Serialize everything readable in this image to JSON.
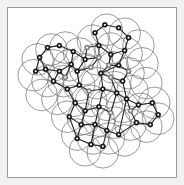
{
  "figure": {
    "kind": "ball-and-stick skeleton overlaid with van der Waals sphere outlines",
    "caption": "",
    "frame": {
      "outer_background": "#f2f2f0",
      "inner_background": "#ffffff",
      "border_color": "#9a9a9a",
      "border_width_px": 1,
      "inset_px": 7,
      "width_px": 170,
      "height_px": 171
    },
    "style": {
      "sphere_stroke": "#6d6d6d",
      "sphere_stroke_width": 0.7,
      "bond_stroke": "#2b2b2b",
      "bond_stroke_width": 1.15,
      "atom_dark_fill": "#1c1c1c",
      "atom_light_fill": "#8e8e8e",
      "atom_core_fill": "#ffffff",
      "atom_radius_px": 2.6,
      "atom_core_radius_px": 1.05
    },
    "counts": {
      "atoms": 52,
      "bonds": 58,
      "spheres": 46
    }
  },
  "chart_data": {
    "type": "scatter",
    "xlabel": "",
    "ylabel": "",
    "xlim": [
      0,
      170
    ],
    "ylim": [
      0,
      171
    ],
    "grid": false,
    "legend": "none",
    "spheres": [
      {
        "cx": 100,
        "cy": 22,
        "r": 16
      },
      {
        "cx": 118,
        "cy": 26,
        "r": 16
      },
      {
        "cx": 86,
        "cy": 33,
        "r": 16
      },
      {
        "cx": 132,
        "cy": 38,
        "r": 16
      },
      {
        "cx": 104,
        "cy": 41,
        "r": 16
      },
      {
        "cx": 120,
        "cy": 46,
        "r": 16
      },
      {
        "cx": 72,
        "cy": 46,
        "r": 16
      },
      {
        "cx": 90,
        "cy": 52,
        "r": 16
      },
      {
        "cx": 136,
        "cy": 56,
        "r": 16
      },
      {
        "cx": 44,
        "cy": 42,
        "r": 16
      },
      {
        "cx": 58,
        "cy": 40,
        "r": 16
      },
      {
        "cx": 30,
        "cy": 52,
        "r": 16
      },
      {
        "cx": 46,
        "cy": 58,
        "r": 16
      },
      {
        "cx": 62,
        "cy": 58,
        "r": 16
      },
      {
        "cx": 78,
        "cy": 62,
        "r": 16
      },
      {
        "cx": 106,
        "cy": 60,
        "r": 16
      },
      {
        "cx": 122,
        "cy": 66,
        "r": 16
      },
      {
        "cx": 26,
        "cy": 68,
        "r": 16
      },
      {
        "cx": 40,
        "cy": 74,
        "r": 16
      },
      {
        "cx": 56,
        "cy": 74,
        "r": 16
      },
      {
        "cx": 72,
        "cy": 78,
        "r": 16
      },
      {
        "cx": 90,
        "cy": 76,
        "r": 16
      },
      {
        "cx": 108,
        "cy": 80,
        "r": 16
      },
      {
        "cx": 126,
        "cy": 84,
        "r": 16
      },
      {
        "cx": 140,
        "cy": 76,
        "r": 16
      },
      {
        "cx": 34,
        "cy": 88,
        "r": 16
      },
      {
        "cx": 50,
        "cy": 92,
        "r": 16
      },
      {
        "cx": 66,
        "cy": 94,
        "r": 16
      },
      {
        "cx": 84,
        "cy": 94,
        "r": 16
      },
      {
        "cx": 100,
        "cy": 98,
        "r": 16
      },
      {
        "cx": 116,
        "cy": 100,
        "r": 16
      },
      {
        "cx": 134,
        "cy": 102,
        "r": 16
      },
      {
        "cx": 148,
        "cy": 96,
        "r": 16
      },
      {
        "cx": 60,
        "cy": 110,
        "r": 16
      },
      {
        "cx": 76,
        "cy": 112,
        "r": 16
      },
      {
        "cx": 92,
        "cy": 114,
        "r": 16
      },
      {
        "cx": 108,
        "cy": 116,
        "r": 16
      },
      {
        "cx": 124,
        "cy": 118,
        "r": 16
      },
      {
        "cx": 140,
        "cy": 120,
        "r": 16
      },
      {
        "cx": 152,
        "cy": 112,
        "r": 16
      },
      {
        "cx": 70,
        "cy": 128,
        "r": 16
      },
      {
        "cx": 86,
        "cy": 132,
        "r": 16
      },
      {
        "cx": 102,
        "cy": 132,
        "r": 16
      },
      {
        "cx": 118,
        "cy": 134,
        "r": 16
      },
      {
        "cx": 78,
        "cy": 144,
        "r": 16
      },
      {
        "cx": 96,
        "cy": 146,
        "r": 16
      }
    ],
    "atoms": [
      {
        "id": 0,
        "x": 98,
        "y": 17,
        "shade": "dark"
      },
      {
        "id": 1,
        "x": 112,
        "y": 20,
        "shade": "dark"
      },
      {
        "id": 2,
        "x": 122,
        "y": 30,
        "shade": "dark"
      },
      {
        "id": 3,
        "x": 118,
        "y": 43,
        "shade": "dark"
      },
      {
        "id": 4,
        "x": 104,
        "y": 47,
        "shade": "dark"
      },
      {
        "id": 5,
        "x": 92,
        "y": 38,
        "shade": "dark"
      },
      {
        "id": 6,
        "x": 88,
        "y": 25,
        "shade": "dark"
      },
      {
        "id": 7,
        "x": 102,
        "y": 58,
        "shade": "light"
      },
      {
        "id": 8,
        "x": 92,
        "y": 50,
        "shade": "light"
      },
      {
        "id": 9,
        "x": 78,
        "y": 52,
        "shade": "dark"
      },
      {
        "id": 10,
        "x": 80,
        "y": 40,
        "shade": "light"
      },
      {
        "id": 11,
        "x": 66,
        "y": 44,
        "shade": "dark"
      },
      {
        "id": 12,
        "x": 52,
        "y": 38,
        "shade": "dark"
      },
      {
        "id": 13,
        "x": 40,
        "y": 40,
        "shade": "dark"
      },
      {
        "id": 14,
        "x": 32,
        "y": 50,
        "shade": "dark"
      },
      {
        "id": 15,
        "x": 38,
        "y": 62,
        "shade": "dark"
      },
      {
        "id": 16,
        "x": 52,
        "y": 64,
        "shade": "dark"
      },
      {
        "id": 17,
        "x": 64,
        "y": 57,
        "shade": "dark"
      },
      {
        "id": 18,
        "x": 28,
        "y": 64,
        "shade": "dark"
      },
      {
        "id": 19,
        "x": 46,
        "y": 74,
        "shade": "dark"
      },
      {
        "id": 20,
        "x": 58,
        "y": 70,
        "shade": "light"
      },
      {
        "id": 21,
        "x": 70,
        "y": 64,
        "shade": "dark"
      },
      {
        "id": 22,
        "x": 84,
        "y": 60,
        "shade": "light"
      },
      {
        "id": 23,
        "x": 112,
        "y": 58,
        "shade": "dark"
      },
      {
        "id": 24,
        "x": 122,
        "y": 64,
        "shade": "light"
      },
      {
        "id": 25,
        "x": 116,
        "y": 74,
        "shade": "dark"
      },
      {
        "id": 26,
        "x": 104,
        "y": 70,
        "shade": "light"
      },
      {
        "id": 27,
        "x": 94,
        "y": 66,
        "shade": "dark"
      },
      {
        "id": 28,
        "x": 60,
        "y": 82,
        "shade": "dark"
      },
      {
        "id": 29,
        "x": 72,
        "y": 78,
        "shade": "dark"
      },
      {
        "id": 30,
        "x": 82,
        "y": 84,
        "shade": "light"
      },
      {
        "id": 31,
        "x": 96,
        "y": 82,
        "shade": "dark"
      },
      {
        "id": 32,
        "x": 110,
        "y": 86,
        "shade": "dark"
      },
      {
        "id": 33,
        "x": 120,
        "y": 92,
        "shade": "dark"
      },
      {
        "id": 34,
        "x": 132,
        "y": 98,
        "shade": "dark"
      },
      {
        "id": 35,
        "x": 146,
        "y": 96,
        "shade": "dark"
      },
      {
        "id": 36,
        "x": 152,
        "y": 108,
        "shade": "dark"
      },
      {
        "id": 37,
        "x": 144,
        "y": 118,
        "shade": "dark"
      },
      {
        "id": 38,
        "x": 130,
        "y": 116,
        "shade": "dark"
      },
      {
        "id": 39,
        "x": 124,
        "y": 104,
        "shade": "light"
      },
      {
        "id": 40,
        "x": 68,
        "y": 96,
        "shade": "dark"
      },
      {
        "id": 41,
        "x": 78,
        "y": 104,
        "shade": "dark"
      },
      {
        "id": 42,
        "x": 92,
        "y": 100,
        "shade": "dark"
      },
      {
        "id": 43,
        "x": 104,
        "y": 106,
        "shade": "light"
      },
      {
        "id": 44,
        "x": 62,
        "y": 110,
        "shade": "dark"
      },
      {
        "id": 45,
        "x": 74,
        "y": 118,
        "shade": "dark"
      },
      {
        "id": 46,
        "x": 88,
        "y": 118,
        "shade": "dark"
      },
      {
        "id": 47,
        "x": 100,
        "y": 124,
        "shade": "dark"
      },
      {
        "id": 48,
        "x": 70,
        "y": 132,
        "shade": "dark"
      },
      {
        "id": 49,
        "x": 84,
        "y": 138,
        "shade": "dark"
      },
      {
        "id": 50,
        "x": 96,
        "y": 140,
        "shade": "dark"
      },
      {
        "id": 51,
        "x": 112,
        "y": 128,
        "shade": "dark"
      }
    ],
    "bonds": [
      [
        0,
        1
      ],
      [
        1,
        2
      ],
      [
        2,
        3
      ],
      [
        3,
        4
      ],
      [
        4,
        5
      ],
      [
        5,
        6
      ],
      [
        6,
        0
      ],
      [
        4,
        7
      ],
      [
        5,
        8
      ],
      [
        8,
        9
      ],
      [
        9,
        10
      ],
      [
        10,
        5
      ],
      [
        9,
        11
      ],
      [
        11,
        12
      ],
      [
        12,
        13
      ],
      [
        13,
        14
      ],
      [
        14,
        15
      ],
      [
        15,
        16
      ],
      [
        16,
        17
      ],
      [
        17,
        11
      ],
      [
        14,
        18
      ],
      [
        18,
        15
      ],
      [
        15,
        19
      ],
      [
        19,
        16
      ],
      [
        16,
        20
      ],
      [
        20,
        17
      ],
      [
        17,
        21
      ],
      [
        21,
        9
      ],
      [
        21,
        22
      ],
      [
        22,
        8
      ],
      [
        3,
        23
      ],
      [
        23,
        24
      ],
      [
        24,
        25
      ],
      [
        25,
        26
      ],
      [
        26,
        27
      ],
      [
        27,
        23
      ],
      [
        7,
        27
      ],
      [
        7,
        4
      ],
      [
        19,
        28
      ],
      [
        28,
        29
      ],
      [
        29,
        21
      ],
      [
        29,
        30
      ],
      [
        30,
        31
      ],
      [
        31,
        27
      ],
      [
        31,
        32
      ],
      [
        32,
        26
      ],
      [
        32,
        33
      ],
      [
        33,
        34
      ],
      [
        34,
        35
      ],
      [
        35,
        36
      ],
      [
        36,
        37
      ],
      [
        37,
        38
      ],
      [
        38,
        39
      ],
      [
        39,
        34
      ],
      [
        33,
        39
      ],
      [
        28,
        40
      ],
      [
        40,
        41
      ],
      [
        41,
        30
      ],
      [
        41,
        42
      ],
      [
        42,
        31
      ],
      [
        42,
        43
      ],
      [
        43,
        32
      ],
      [
        40,
        44
      ],
      [
        44,
        45
      ],
      [
        45,
        41
      ],
      [
        45,
        46
      ],
      [
        46,
        42
      ],
      [
        46,
        47
      ],
      [
        47,
        43
      ],
      [
        44,
        48
      ],
      [
        48,
        45
      ],
      [
        48,
        49
      ],
      [
        49,
        46
      ],
      [
        49,
        50
      ],
      [
        50,
        47
      ],
      [
        47,
        51
      ],
      [
        51,
        38
      ],
      [
        51,
        33
      ],
      [
        25,
        33
      ],
      [
        23,
        7
      ],
      [
        13,
        12
      ]
    ]
  }
}
